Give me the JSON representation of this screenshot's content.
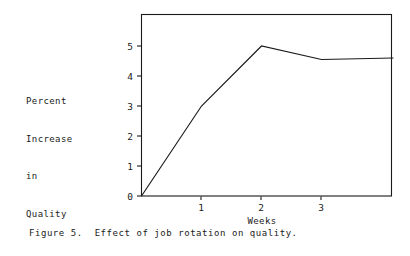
{
  "figure": {
    "caption": "Figure 5.  Effect of job rotation on quality.",
    "background_color": "#ffffff",
    "ink_color": "#1a1a1a"
  },
  "axis_label_block": {
    "lines": [
      "Percent",
      "Increase",
      "in",
      "Quality"
    ]
  },
  "chart_data": {
    "type": "line",
    "title": "",
    "xlabel": "Weeks",
    "ylabel": "Percent Increase in Quality",
    "x": [
      0,
      1,
      2,
      3,
      4.2
    ],
    "values": [
      0,
      3.0,
      5.0,
      4.55,
      4.6
    ],
    "series": [
      {
        "name": "Percent increase in quality",
        "x": [
          0,
          1,
          2,
          3,
          4.2
        ],
        "values": [
          0,
          3.0,
          5.0,
          4.55,
          4.6
        ]
      }
    ],
    "xlim": [
      0,
      4.2
    ],
    "ylim": [
      0,
      6.07
    ],
    "xticks": [
      1,
      2,
      3
    ],
    "xticklabels": [
      "1",
      "2",
      "3"
    ],
    "yticks": [
      0,
      1,
      2,
      3,
      4,
      5
    ],
    "yticklabels": [
      "0",
      "1",
      "2",
      "3",
      "4",
      "5"
    ],
    "grid": false,
    "legend": false,
    "line_color": "#1a1a1a",
    "frame": true
  },
  "axes": {
    "x_tick_labels": [
      "1",
      "2",
      "3"
    ],
    "y_tick_labels": [
      "0",
      "1",
      "2",
      "3",
      "4",
      "5"
    ],
    "x_axis_title": "Weeks"
  }
}
